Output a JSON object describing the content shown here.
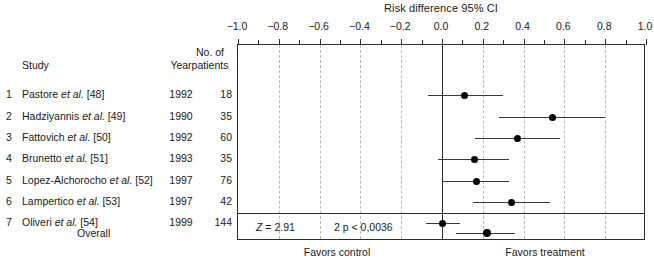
{
  "chart_data": {
    "type": "forest",
    "title": "Risk difference 95% CI",
    "xlabel": "",
    "ylabel": "",
    "xlim": [
      -1.0,
      1.0
    ],
    "xticks": [
      -1.0,
      -0.8,
      -0.6,
      -0.4,
      -0.2,
      0.0,
      0.2,
      0.4,
      0.6,
      0.8,
      1.0
    ],
    "xtick_labels": [
      "−1.0",
      "−0.8",
      "−0.6",
      "−0.4",
      "−0.2",
      "0.0",
      "0.2",
      "0.4",
      "0.6",
      "0.8",
      "1.0"
    ],
    "minor_ticks": true,
    "grid": "vertical-dashed-at-major-ticks",
    "zero_reference_line": 0.0,
    "left_footer_label": "Favors control",
    "right_footer_label": "Favors treatment",
    "columns": [
      "Study",
      "Year",
      "No. of patients"
    ],
    "column_headers": {
      "index": "",
      "study": "Study",
      "year": "Year",
      "patients_line1": "No. of",
      "patients_line2": "patients"
    },
    "rows": [
      {
        "index": "1",
        "study_author": "Pastore",
        "study_etal": "et al.",
        "study_ref": "[48]",
        "study_full": "Pastore et al. [48]",
        "year": "1992",
        "patients": "18",
        "estimate": 0.11,
        "ci_low": -0.07,
        "ci_high": 0.3
      },
      {
        "index": "2",
        "study_author": "Hadziyannis",
        "study_etal": "et al.",
        "study_ref": "[49]",
        "study_full": "Hadziyannis et al. [49]",
        "year": "1990",
        "patients": "35",
        "estimate": 0.54,
        "ci_low": 0.28,
        "ci_high": 0.8
      },
      {
        "index": "3",
        "study_author": "Fattovich",
        "study_etal": "et al.",
        "study_ref": "[50]",
        "study_full": "Fattovich et al. [50]",
        "year": "1992",
        "patients": "60",
        "estimate": 0.37,
        "ci_low": 0.16,
        "ci_high": 0.58
      },
      {
        "index": "4",
        "study_author": "Brunetto",
        "study_etal": "et al.",
        "study_ref": "[51]",
        "study_full": "Brunetto et al. [51]",
        "year": "1993",
        "patients": "35",
        "estimate": 0.16,
        "ci_low": -0.02,
        "ci_high": 0.33
      },
      {
        "index": "5",
        "study_author": "Lopez-Alchorocho",
        "study_etal": "et al.",
        "study_ref": "[52]",
        "study_full": "Lopez-Alchorocho et al. [52]",
        "year": "1997",
        "patients": "76",
        "estimate": 0.17,
        "ci_low": 0.0,
        "ci_high": 0.33
      },
      {
        "index": "6",
        "study_author": "Lampertico",
        "study_etal": "et al.",
        "study_ref": "[53]",
        "study_full": "Lampertico et al. [53]",
        "year": "1997",
        "patients": "42",
        "estimate": 0.34,
        "ci_low": 0.15,
        "ci_high": 0.53
      },
      {
        "index": "7",
        "study_author": "Oliveri",
        "study_etal": "et al.",
        "study_ref": "[54]",
        "study_full": "Oliveri et al. [54]",
        "year": "1999",
        "patients": "144",
        "estimate": 0.0,
        "ci_low": -0.08,
        "ci_high": 0.09
      }
    ],
    "overall": {
      "label": "Overall",
      "estimate": 0.22,
      "ci_low": 0.07,
      "ci_high": 0.36
    },
    "statistics": {
      "z_symbol": "Z",
      "z_text": "= 2.91",
      "z_full": "Z = 2.91",
      "p_text": "2 p < 0,0036"
    },
    "colors": {
      "marker": "#000000",
      "ci_line": "#3a3a3a",
      "axis": "#2b2b2b",
      "gridline": "#b9b9b9",
      "text": "#1a1a1a",
      "background": "#ffffff"
    }
  }
}
